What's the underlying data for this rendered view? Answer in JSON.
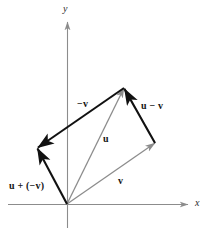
{
  "figure": {
    "name": "vector-subtraction-parallelogram",
    "background_color": "#ffffff",
    "width": 208,
    "height": 233
  },
  "axes": {
    "x_label": "x",
    "y_label": "y",
    "color": "#8c8c8c",
    "origin": {
      "x": 67,
      "y": 204
    },
    "x_axis": {
      "from": {
        "x": 8,
        "y": 204
      },
      "to": {
        "x": 191,
        "y": 204
      }
    },
    "y_axis": {
      "from": {
        "x": 67,
        "y": 228
      },
      "to": {
        "x": 67,
        "y": 19
      }
    }
  },
  "colors": {
    "black_vector": "#111111",
    "gray_vector": "#8c8c8c",
    "axis": "#8c8c8c",
    "text": "#141414"
  },
  "vectors": [
    {
      "name": "u",
      "label": "u",
      "style": "gray",
      "from": {
        "x": 67,
        "y": 204
      },
      "to": {
        "x": 124,
        "y": 88
      },
      "label_pos": {
        "x": 103,
        "y": 134
      }
    },
    {
      "name": "v",
      "label": "v",
      "style": "gray",
      "from": {
        "x": 67,
        "y": 204
      },
      "to": {
        "x": 155,
        "y": 143
      },
      "label_pos": {
        "x": 118,
        "y": 176
      }
    },
    {
      "name": "neg-v",
      "label": "−v",
      "style": "black",
      "from": {
        "x": 124,
        "y": 88
      },
      "to": {
        "x": 37,
        "y": 148
      },
      "label_pos": {
        "x": 77,
        "y": 99
      }
    },
    {
      "name": "u-minus-v",
      "label": "u − v",
      "style": "black",
      "from": {
        "x": 155,
        "y": 143
      },
      "to": {
        "x": 124,
        "y": 88
      },
      "label_pos": {
        "x": 141,
        "y": 101
      }
    },
    {
      "name": "u-plus-neg-v",
      "label": "u + (−v)",
      "style": "black",
      "from": {
        "x": 67,
        "y": 204
      },
      "to": {
        "x": 37,
        "y": 148
      },
      "label_pos": {
        "x": 9,
        "y": 181
      }
    }
  ],
  "construction_lines": [
    {
      "name": "parallelogram-edge-v-to-u-tip",
      "style": "gray",
      "from": {
        "x": 155,
        "y": 143
      },
      "to": {
        "x": 124,
        "y": 88
      }
    }
  ]
}
